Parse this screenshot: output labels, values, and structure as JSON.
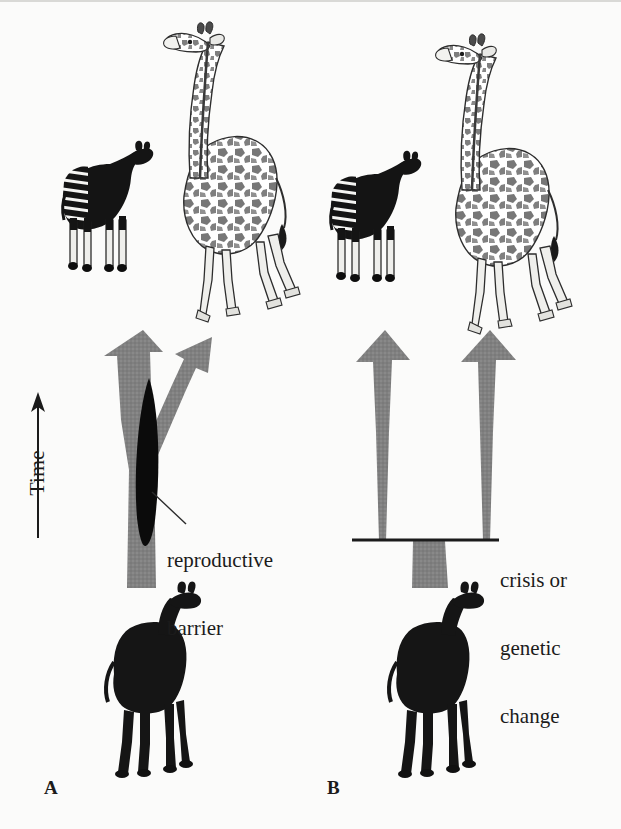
{
  "figure": {
    "background_color": "#fbfbfa",
    "ink_color": "#1b1b1b",
    "arrow_gray": "#808080",
    "axis": {
      "label": "Time",
      "direction": "upward-arrow",
      "arrow_icon": "up-arrow-icon"
    },
    "panels": [
      {
        "id": "A",
        "label": "A",
        "model": "gradual-split-with-reproductive-barrier",
        "annotation": "reproductive\nbarrier",
        "annotation_lines": [
          "reproductive",
          "barrier"
        ],
        "barrier_shape": "black-lens",
        "arrow_count": 2,
        "arrow_style": "Y-shaped fork rising from single trunk",
        "descendants": [
          "okapi",
          "giraffe"
        ],
        "ancestor": "dark giraffe-like ancestor silhouette"
      },
      {
        "id": "B",
        "label": "B",
        "model": "punctuated-split-at-crisis-line",
        "annotation": "crisis or\ngenetic\nchange",
        "annotation_lines": [
          "crisis or",
          "genetic",
          "change"
        ],
        "barrier_shape": "horizontal-line",
        "arrow_count": 2,
        "arrow_style": "two separate tapered arrows above a horizontal event line",
        "descendants": [
          "okapi",
          "giraffe"
        ],
        "ancestor": "dark giraffe-like ancestor silhouette"
      }
    ],
    "animals": {
      "okapi": {
        "name": "okapi",
        "fill": "#141414",
        "features": "striped hindquarters, white lower legs, dark hooves, short neck"
      },
      "giraffe": {
        "name": "giraffe",
        "fill": "#ffffff",
        "features": "long neck, reticulated spot pattern, long pale legs"
      },
      "ancestor": {
        "name": "ancestral giraffid",
        "fill": "#151515",
        "features": "solid dark silhouette, medium neck"
      }
    }
  }
}
